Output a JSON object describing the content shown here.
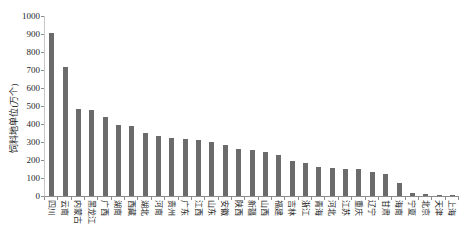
{
  "chart_data": {
    "type": "bar",
    "title": "",
    "xlabel": "",
    "ylabel": "饲料地单位(万个)",
    "categories": [
      "四川",
      "云南",
      "内蒙古",
      "黑龙江",
      "广西",
      "湖南",
      "西藏",
      "湖北",
      "河南",
      "贵州",
      "广东",
      "江西",
      "山东",
      "安徽",
      "陕西",
      "新疆",
      "山西",
      "福建",
      "吉林",
      "浙江",
      "青海",
      "河北",
      "江苏",
      "重庆",
      "辽宁",
      "甘肃",
      "海南",
      "宁夏",
      "北京",
      "天津",
      "上海"
    ],
    "values": [
      905,
      715,
      485,
      480,
      438,
      396,
      391,
      353,
      336,
      323,
      315,
      309,
      298,
      283,
      264,
      257,
      243,
      228,
      196,
      181,
      163,
      157,
      153,
      148,
      133,
      121,
      70,
      19,
      9,
      6,
      4
    ],
    "ylim": [
      0,
      1000
    ],
    "ytick_step": 100,
    "grid": false,
    "legend": false,
    "bar_color": "#6b6b6b",
    "axis_color": "#8c8c8c",
    "text_color": "#1f1f1f"
  }
}
